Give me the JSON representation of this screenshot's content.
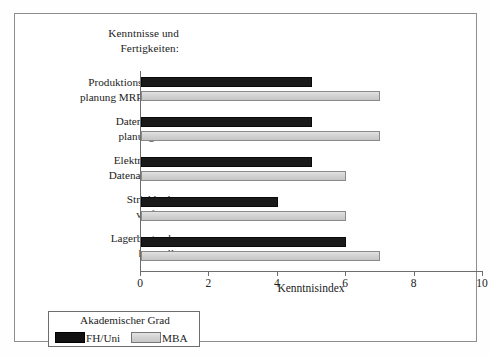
{
  "chart_data": {
    "type": "bar",
    "orientation": "horizontal",
    "title": "",
    "axis_group_title": "Kenntnisse und Fertigkeiten:",
    "categories": [
      "Produktionsbedarfsplanung MRP/MRP II",
      "Datenbedarfsplanung DRP",
      "Elektronischer Datenaustausch",
      "Strichkodeverfahren",
      "Lagerbestandskontrolle"
    ],
    "category_lines": [
      [
        "Produktionsbedarfs-",
        "planung MRP/MRP II"
      ],
      [
        "Datenbedarfs-",
        "planung DRP"
      ],
      [
        "Elektronischer",
        "Datenaustausch"
      ],
      [
        "Strichkode-",
        "verfahren"
      ],
      [
        "Lagerbestands-",
        "kontrolle"
      ]
    ],
    "series": [
      {
        "name": "FH/Uni",
        "color": "#111111",
        "values": [
          5,
          5,
          5,
          4,
          6
        ]
      },
      {
        "name": "MBA",
        "color": "#d2d2d2",
        "values": [
          7,
          7,
          6,
          6,
          7
        ]
      }
    ],
    "xlabel": "Kenntnisindex",
    "ylabel": "",
    "xlim": [
      0,
      10
    ],
    "xticks": [
      0,
      2,
      4,
      6,
      8,
      10
    ],
    "xtick_labels": [
      "0",
      "2",
      "4",
      "6",
      "8",
      "10"
    ],
    "grid": false,
    "legend_position": "bottom-left",
    "legend_title": "Akademischer Grad"
  },
  "axis_title": {
    "line1": "Kenntnisse und",
    "line2": "Fertigkeiten:"
  },
  "legend": {
    "title": "Akademischer Grad",
    "items": [
      {
        "label": "FH/Uni",
        "color": "#111111"
      },
      {
        "label": "MBA",
        "color": "#d2d2d2"
      }
    ]
  }
}
